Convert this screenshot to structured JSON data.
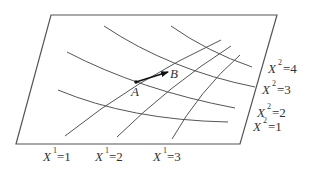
{
  "diagram": {
    "points": {
      "A": {
        "label": "A"
      },
      "B": {
        "label": "B"
      }
    },
    "x1_lines": [
      {
        "var": "X",
        "sup": "1",
        "eq": "=1"
      },
      {
        "var": "X",
        "sup": "1",
        "eq": "=2"
      },
      {
        "var": "X",
        "sup": "1",
        "eq": "=3"
      }
    ],
    "x2_curves": [
      {
        "var": "X",
        "sup": "2",
        "eq": "=4"
      },
      {
        "var": "X",
        "sup": "2",
        "eq": "=3"
      },
      {
        "var": "X",
        "sup": "2",
        "eq": "=2"
      },
      {
        "var": "X",
        "sup": "2",
        "eq": "=1"
      }
    ],
    "colors": {
      "line": "#555555",
      "vector": "#111111",
      "text": "#333333",
      "background": "#ffffff"
    }
  }
}
